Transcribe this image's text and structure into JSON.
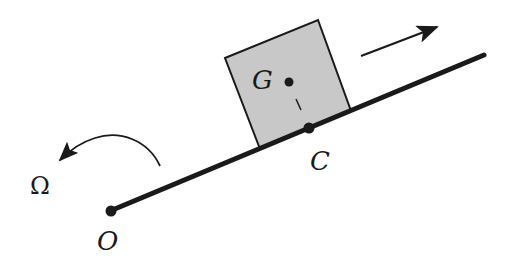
{
  "diagram": {
    "title": "",
    "colors": {
      "background": "#ffffff",
      "ink": "#1a1a1a",
      "block_fill": "#c8c8c8"
    },
    "labels": {
      "center_of_mass": "G",
      "contact_point": "C",
      "pivot": "O",
      "angular_velocity": "Ω"
    },
    "elements": {
      "rod": {
        "from": [
          110,
          211
        ],
        "to": [
          484,
          55
        ]
      },
      "block": {
        "corners": [
          [
            225,
            58
          ],
          [
            318,
            20
          ],
          [
            351,
            111
          ],
          [
            260,
            149
          ]
        ]
      },
      "point_G": [
        289,
        82
      ],
      "point_C": [
        309,
        128
      ],
      "point_O": [
        110,
        211
      ],
      "motion_arrow": {
        "from": [
          361,
          56
        ],
        "to": [
          437,
          27
        ]
      },
      "rotation_arrow": {
        "from": [
          160,
          166
        ],
        "to": [
          60,
          160
        ]
      }
    }
  }
}
